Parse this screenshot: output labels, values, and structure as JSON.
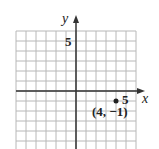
{
  "chart_data": {
    "type": "scatter",
    "title": "",
    "xlabel": "x",
    "ylabel": "y",
    "xlim": [
      -6,
      6
    ],
    "ylim": [
      -6,
      6
    ],
    "grid": true,
    "x_tick_labels": [
      {
        "value": 5,
        "label": "5"
      }
    ],
    "y_tick_labels": [
      {
        "value": 5,
        "label": "5"
      }
    ],
    "points": [
      {
        "x": 4,
        "y": -1,
        "label": "(4, −1)"
      }
    ],
    "annotations": [
      "(4, −1)"
    ]
  },
  "labels": {
    "x_axis": "x",
    "y_axis": "y",
    "x_tick": "5",
    "y_tick": "5",
    "point": "(4, −1)"
  },
  "colors": {
    "grid": "#b8b8b8",
    "axis": "#333333",
    "point": "#222222"
  }
}
